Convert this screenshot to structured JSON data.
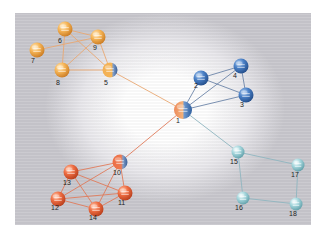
{
  "diagram": {
    "type": "network-graph",
    "colors": {
      "orange_cluster": "#f0a040",
      "blue_cluster": "#3a6fb8",
      "red_cluster": "#e8613a",
      "teal_cluster": "#8cc7cf",
      "edge_orange": "#e9a873",
      "edge_blue": "#6c84a8",
      "edge_red": "#e07a5a",
      "edge_teal": "#8fb6bf"
    },
    "nodes": [
      {
        "id": "1",
        "label": "1",
        "x": 183,
        "y": 110,
        "cluster": "hub",
        "lx": 176,
        "ly": 123
      },
      {
        "id": "2",
        "label": "2",
        "x": 201,
        "y": 78,
        "cluster": "blue",
        "lx": 194,
        "ly": 88
      },
      {
        "id": "3",
        "label": "3",
        "x": 246,
        "y": 95,
        "cluster": "blue",
        "lx": 240,
        "ly": 107
      },
      {
        "id": "4",
        "label": "4",
        "x": 241,
        "y": 66,
        "cluster": "blue",
        "lx": 233,
        "ly": 78
      },
      {
        "id": "5",
        "label": "5",
        "x": 110,
        "y": 70,
        "cluster": "orange",
        "lx": 104,
        "ly": 85
      },
      {
        "id": "6",
        "label": "6",
        "x": 65,
        "y": 29,
        "cluster": "orange",
        "lx": 58,
        "ly": 43
      },
      {
        "id": "7",
        "label": "7",
        "x": 37,
        "y": 50,
        "cluster": "orange",
        "lx": 31,
        "ly": 63
      },
      {
        "id": "8",
        "label": "8",
        "x": 62,
        "y": 70,
        "cluster": "orange",
        "lx": 56,
        "ly": 85
      },
      {
        "id": "9",
        "label": "9",
        "x": 98,
        "y": 37,
        "cluster": "orange",
        "lx": 93,
        "ly": 50
      },
      {
        "id": "10",
        "label": "10",
        "x": 120,
        "y": 162,
        "cluster": "red",
        "lx": 113,
        "ly": 175
      },
      {
        "id": "11",
        "label": "11",
        "x": 125,
        "y": 193,
        "cluster": "red",
        "lx": 118,
        "ly": 205
      },
      {
        "id": "12",
        "label": "12",
        "x": 58,
        "y": 199,
        "cluster": "red",
        "lx": 51,
        "ly": 210
      },
      {
        "id": "13",
        "label": "13",
        "x": 71,
        "y": 172,
        "cluster": "red",
        "lx": 63,
        "ly": 185
      },
      {
        "id": "14",
        "label": "14",
        "x": 96,
        "y": 209,
        "cluster": "red",
        "lx": 89,
        "ly": 220
      },
      {
        "id": "15",
        "label": "15",
        "x": 238,
        "y": 152,
        "cluster": "teal",
        "lx": 230,
        "ly": 164
      },
      {
        "id": "16",
        "label": "16",
        "x": 243,
        "y": 198,
        "cluster": "teal",
        "lx": 235,
        "ly": 210
      },
      {
        "id": "17",
        "label": "17",
        "x": 298,
        "y": 165,
        "cluster": "teal",
        "lx": 291,
        "ly": 177
      },
      {
        "id": "18",
        "label": "18",
        "x": 296,
        "y": 204,
        "cluster": "teal",
        "lx": 289,
        "ly": 216
      }
    ],
    "edges": [
      {
        "from": "1",
        "to": "5",
        "color": "edge_orange"
      },
      {
        "from": "1",
        "to": "10",
        "color": "edge_red"
      },
      {
        "from": "1",
        "to": "15",
        "color": "edge_teal"
      },
      {
        "from": "1",
        "to": "2",
        "color": "edge_blue"
      },
      {
        "from": "1",
        "to": "4",
        "color": "edge_blue"
      },
      {
        "from": "1",
        "to": "3",
        "color": "edge_blue"
      },
      {
        "from": "2",
        "to": "4",
        "color": "edge_blue"
      },
      {
        "from": "2",
        "to": "3",
        "color": "edge_blue"
      },
      {
        "from": "4",
        "to": "3",
        "color": "edge_blue"
      },
      {
        "from": "5",
        "to": "9",
        "color": "edge_orange"
      },
      {
        "from": "5",
        "to": "6",
        "color": "edge_orange"
      },
      {
        "from": "5",
        "to": "8",
        "color": "edge_orange"
      },
      {
        "from": "6",
        "to": "9",
        "color": "edge_orange"
      },
      {
        "from": "6",
        "to": "8",
        "color": "edge_orange"
      },
      {
        "from": "7",
        "to": "9",
        "color": "edge_orange"
      },
      {
        "from": "8",
        "to": "9",
        "color": "edge_orange"
      },
      {
        "from": "10",
        "to": "13",
        "color": "edge_red"
      },
      {
        "from": "10",
        "to": "12",
        "color": "edge_red"
      },
      {
        "from": "10",
        "to": "11",
        "color": "edge_red"
      },
      {
        "from": "10",
        "to": "14",
        "color": "edge_red"
      },
      {
        "from": "13",
        "to": "12",
        "color": "edge_red"
      },
      {
        "from": "13",
        "to": "11",
        "color": "edge_red"
      },
      {
        "from": "13",
        "to": "14",
        "color": "edge_red"
      },
      {
        "from": "12",
        "to": "11",
        "color": "edge_red"
      },
      {
        "from": "12",
        "to": "14",
        "color": "edge_red"
      },
      {
        "from": "14",
        "to": "11",
        "color": "edge_red"
      },
      {
        "from": "15",
        "to": "17",
        "color": "edge_teal"
      },
      {
        "from": "15",
        "to": "16",
        "color": "edge_teal"
      },
      {
        "from": "16",
        "to": "18",
        "color": "edge_teal"
      },
      {
        "from": "17",
        "to": "18",
        "color": "edge_teal"
      }
    ]
  }
}
